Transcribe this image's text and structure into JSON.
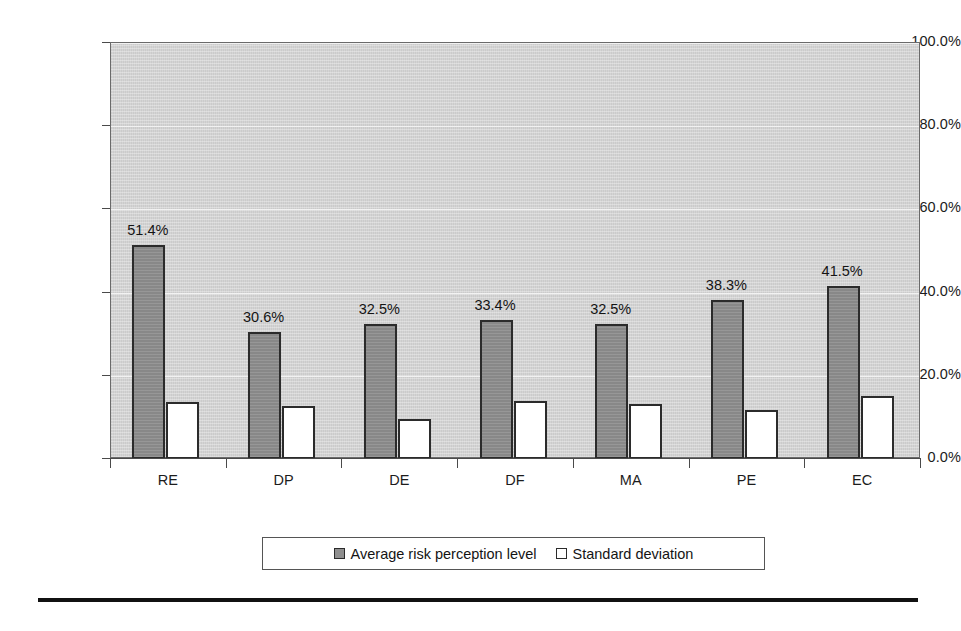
{
  "chart_data": {
    "type": "bar",
    "title": "",
    "subtitle": "",
    "xlabel": "",
    "ylabel": "",
    "categories": [
      "RE",
      "DP",
      "DE",
      "DF",
      "MA",
      "PE",
      "EC"
    ],
    "ylim": [
      0,
      100
    ],
    "ytick_values": [
      100,
      80,
      60,
      40,
      20,
      0
    ],
    "ytick_labels": [
      "100.0%",
      "80.0%",
      "60.0%",
      "40.0%",
      "20.0%",
      "0.0%"
    ],
    "grid": true,
    "legend_position": "bottom",
    "value_label_format": "percent-one-decimal",
    "series": [
      {
        "name": "Average risk perception level",
        "color": "#8f8f8f",
        "values": [
          51.4,
          30.6,
          32.5,
          33.4,
          32.5,
          38.3,
          41.5
        ],
        "data_labels": [
          "51.4%",
          "30.6%",
          "32.5%",
          "33.4%",
          "32.5%",
          "38.3%",
          "41.5%"
        ]
      },
      {
        "name": "Standard deviation",
        "color": "#ffffff",
        "values": [
          13.7,
          12.7,
          9.7,
          14.0,
          13.2,
          11.8,
          15.2
        ],
        "data_labels": [
          "",
          "",
          "",
          "",
          "",
          "",
          ""
        ]
      }
    ]
  },
  "legend": {
    "entries": [
      {
        "label": "Average risk perception level",
        "swatch": "avg"
      },
      {
        "label": "Standard deviation",
        "swatch": "std"
      }
    ]
  },
  "colors": {
    "plot_background": "#d2d2d2",
    "series_avg": "#8f8f8f",
    "series_std": "#ffffff",
    "bar_outline": "#2b2b2b",
    "gridline": "#f2f2f2",
    "axis": "#4a4a4a",
    "text": "#141414"
  }
}
